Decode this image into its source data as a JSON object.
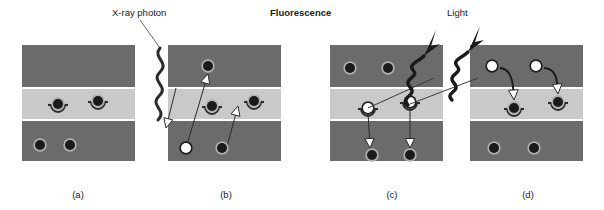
{
  "figure": {
    "title_caption": "",
    "annotations": [
      {
        "name": "xray-photon-label",
        "text": "X-ray photon",
        "x": 112,
        "y": 8,
        "bold": false
      },
      {
        "name": "fluorescence-label",
        "text": "Fluorescence",
        "x": 270,
        "y": 8,
        "bold": true
      },
      {
        "name": "light-label",
        "text": "Light",
        "x": 447,
        "y": 8,
        "bold": false
      }
    ],
    "panel_labels": [
      {
        "name": "panel-label-a",
        "text": "(a)",
        "cx": 78,
        "y": 190
      },
      {
        "name": "panel-label-b",
        "text": "(b)",
        "cx": 226,
        "y": 190
      },
      {
        "name": "panel-label-c",
        "text": "(c)",
        "cx": 392,
        "y": 190
      },
      {
        "name": "panel-label-d",
        "text": "(d)",
        "cx": 528,
        "y": 190
      }
    ],
    "colors": {
      "conduction_band": "#6b6b6b",
      "valence_band": "#6b6b6b",
      "mid_band": "#c9c9c9",
      "electron_fill": "#1a1a1a",
      "hole_fill": "#ffffff",
      "electron_ring": "#b0b0b0",
      "arrow_white_fill": "#ffffff",
      "arrow_stroke": "#2b2b2b",
      "photon_stroke": "#2b2b2b",
      "text": "#1a1a1a",
      "background": "#ffffff"
    },
    "band_geometry": {
      "top_band_y": 45,
      "top_band_h": 42,
      "mid_band_y": 89,
      "mid_band_h": 30,
      "bot_band_y": 121,
      "bot_band_h": 40,
      "panel_width": 113
    },
    "panels": [
      {
        "id": "a",
        "name": "panel-a",
        "x": 22,
        "description": "Ground state: trap electrons in mid band, valence electrons in bottom band",
        "particles": [
          {
            "band": "mid",
            "type": "electron-trap",
            "cx": 36,
            "cy": 104
          },
          {
            "band": "mid",
            "type": "electron-trap",
            "cx": 76,
            "cy": 101
          },
          {
            "band": "bot",
            "type": "electron",
            "cx": 18,
            "cy": 145
          },
          {
            "band": "bot",
            "type": "electron",
            "cx": 48,
            "cy": 145
          }
        ],
        "arrows": []
      },
      {
        "id": "b",
        "name": "panel-b",
        "x": 168,
        "description": "X-ray photon excites an electron from valence band to conduction band leaving a hole",
        "particles": [
          {
            "band": "top",
            "type": "electron",
            "cx": 40,
            "cy": 66
          },
          {
            "band": "mid",
            "type": "electron-trap",
            "cx": 44,
            "cy": 106
          },
          {
            "band": "mid",
            "type": "electron-trap",
            "cx": 86,
            "cy": 101
          },
          {
            "band": "bot",
            "type": "hole",
            "cx": 18,
            "cy": 148
          },
          {
            "band": "bot",
            "type": "electron",
            "cx": 54,
            "cy": 148
          }
        ],
        "arrows": [
          {
            "type": "white-filled",
            "x1": 18,
            "y1": 148,
            "x2": 40,
            "y2": 74,
            "name": "electron-excitation-arrow"
          },
          {
            "type": "white-filled",
            "x1": 8,
            "y1": 88,
            "x2": -2,
            "y2": 128,
            "name": "photon-absorption-arrow"
          },
          {
            "type": "white-filled",
            "x1": 58,
            "y1": 150,
            "x2": 70,
            "y2": 106,
            "name": "electron-trapping-arrow"
          }
        ]
      },
      {
        "id": "c",
        "name": "panel-c",
        "x": 330,
        "description": "Trapped carriers recombine; light is emitted as fluorescence",
        "particles": [
          {
            "band": "top",
            "type": "electron",
            "cx": 20,
            "cy": 68
          },
          {
            "band": "top",
            "type": "electron",
            "cx": 58,
            "cy": 68
          },
          {
            "band": "mid",
            "type": "hole-trap",
            "cx": 38,
            "cy": 108
          },
          {
            "band": "mid",
            "type": "hole-trap",
            "cx": 80,
            "cy": 102
          },
          {
            "band": "bot",
            "type": "electron",
            "cx": 42,
            "cy": 155
          },
          {
            "band": "bot",
            "type": "electron",
            "cx": 80,
            "cy": 155
          }
        ],
        "arrows": [
          {
            "type": "white-filled",
            "x1": 38,
            "y1": 112,
            "x2": 40,
            "y2": 148,
            "name": "hole-relaxation-arrow-1"
          },
          {
            "type": "white-filled",
            "x1": 80,
            "y1": 108,
            "x2": 80,
            "y2": 148,
            "name": "hole-relaxation-arrow-2"
          }
        ],
        "photon_emissions": [
          {
            "name": "emitted-light-photon-1",
            "x": 78,
            "y": 90
          },
          {
            "name": "emitted-light-photon-2",
            "x": 122,
            "y": 90
          }
        ]
      },
      {
        "id": "d",
        "name": "panel-d",
        "x": 470,
        "description": "Conduction band holes drop into trap states completing the cycle",
        "particles": [
          {
            "band": "top",
            "type": "hole",
            "cx": 22,
            "cy": 66
          },
          {
            "band": "top",
            "type": "hole",
            "cx": 66,
            "cy": 66
          },
          {
            "band": "mid",
            "type": "electron-trap",
            "cx": 44,
            "cy": 108
          },
          {
            "band": "mid",
            "type": "electron-trap",
            "cx": 88,
            "cy": 102
          },
          {
            "band": "bot",
            "type": "electron",
            "cx": 24,
            "cy": 148
          },
          {
            "band": "bot",
            "type": "electron",
            "cx": 64,
            "cy": 148
          }
        ],
        "arrows": [
          {
            "type": "curved-white",
            "x1": 30,
            "y1": 68,
            "x2": 44,
            "y2": 100,
            "name": "carrier-capture-arrow-1"
          },
          {
            "type": "curved-white",
            "x1": 74,
            "y1": 68,
            "x2": 88,
            "y2": 94,
            "name": "carrier-capture-arrow-2"
          }
        ]
      }
    ],
    "photon_paths": {
      "incident_xray": {
        "name": "incident-xray-photon-path",
        "leader_x1": 140,
        "leader_y1": 20,
        "leader_x2": 160,
        "leader_y2": 48,
        "zigzag_desc": "wavy line descending into panel b valence band"
      }
    }
  }
}
